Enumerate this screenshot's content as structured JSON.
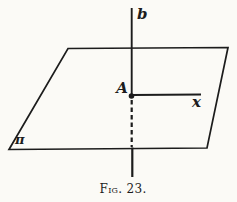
{
  "figure": {
    "caption": "Fig. 23.",
    "labels": {
      "vertical_line": "b",
      "intersection_point": "A",
      "horizontal_ray": "x",
      "plane": "π"
    },
    "colors": {
      "ink": "#1c1c1c",
      "paper": "#fbfaf6"
    }
  }
}
